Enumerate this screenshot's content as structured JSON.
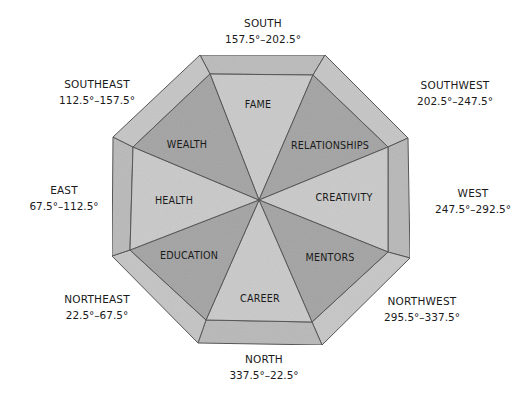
{
  "diagram": {
    "type": "bagua-octagon",
    "colors": {
      "outer_ring_light": "#c9c9c9",
      "outer_ring_mid": "#bdbdbd",
      "sector_dark": "#a9a9a9",
      "sector_light": "#cdcdcd",
      "line": "#5a5a5a"
    },
    "directions": [
      {
        "name": "SOUTH",
        "range": "157.5°–202.5°"
      },
      {
        "name": "SOUTHWEST",
        "range": "202.5°–247.5°"
      },
      {
        "name": "WEST",
        "range": "247.5°–292.5°"
      },
      {
        "name": "NORTHWEST",
        "range": "295.5°–337.5°"
      },
      {
        "name": "NORTH",
        "range": "337.5°–22.5°"
      },
      {
        "name": "NORTHEAST",
        "range": "22.5°–67.5°"
      },
      {
        "name": "EAST",
        "range": "67.5°–112.5°"
      },
      {
        "name": "SOUTHEAST",
        "range": "112.5°–157.5°"
      }
    ],
    "areas": [
      {
        "label": "FAME"
      },
      {
        "label": "RELATIONSHIPS"
      },
      {
        "label": "CREATIVITY"
      },
      {
        "label": "MENTORS"
      },
      {
        "label": "CAREER"
      },
      {
        "label": "EDUCATION"
      },
      {
        "label": "HEALTH"
      },
      {
        "label": "WEALTH"
      }
    ]
  }
}
